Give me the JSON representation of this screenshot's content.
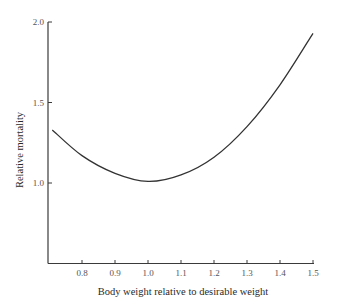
{
  "chart_data": {
    "type": "line",
    "title": "",
    "xlabel": "Body weight relative to desirable weight",
    "ylabel": "Relative mortality",
    "xlim": [
      0.7,
      1.5
    ],
    "ylim": [
      0.5,
      2.0
    ],
    "x_ticks": [
      "0.8",
      "0.9",
      "1.0",
      "1.1",
      "1.2",
      "1.3",
      "1.4",
      "1.5"
    ],
    "y_ticks": [
      "1.0",
      "1.5",
      "2.0"
    ],
    "grid": false,
    "legend": null,
    "series": [
      {
        "name": "Relative mortality",
        "color": "#333333",
        "x": [
          0.71,
          0.8,
          0.9,
          1.0,
          1.1,
          1.2,
          1.3,
          1.4,
          1.5
        ],
        "y": [
          1.33,
          1.17,
          1.06,
          1.01,
          1.05,
          1.16,
          1.35,
          1.61,
          1.93
        ]
      }
    ]
  }
}
